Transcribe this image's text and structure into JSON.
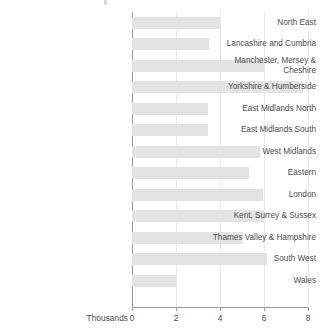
{
  "chart_data": {
    "type": "bar",
    "orientation": "horizontal",
    "title": "",
    "xlabel": "Thousands",
    "ylabel": "",
    "xlim": [
      0,
      8
    ],
    "xticks": [
      0,
      2,
      4,
      6,
      8
    ],
    "xtick_labels": [
      "0",
      "2",
      "4",
      "6",
      "8"
    ],
    "grid": true,
    "grid_axis": "x",
    "legend": false,
    "bar_color": "#e3e3e3",
    "categories": [
      "North East",
      "Lancashire and Cumbria",
      "Manchester, Mersey &\nCheshire",
      "Yorkshire & Humberside",
      "East Midlands North",
      "East Midlands South",
      "West Midlands",
      "Eastern",
      "London",
      "Kent, Surrey & Sussex",
      "Thames Valley & Hampshire",
      "South West",
      "Wales"
    ],
    "values": [
      4.0,
      3.5,
      6.0,
      7.75,
      3.45,
      3.45,
      5.8,
      5.3,
      5.95,
      6.0,
      5.05,
      6.15,
      2.0
    ]
  },
  "axis": {
    "units_label": "Thousands"
  }
}
